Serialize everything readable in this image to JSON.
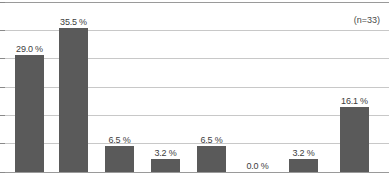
{
  "annotation": {
    "sample_size_label": "(n=33)"
  },
  "chart_data": {
    "type": "bar",
    "title": "",
    "subtitle": "",
    "xlabel": "",
    "ylabel": "",
    "categories": [
      "1",
      "2",
      "3",
      "4",
      "5",
      "6",
      "7",
      "8"
    ],
    "values": [
      29.0,
      35.5,
      6.5,
      3.2,
      6.5,
      0.0,
      3.2,
      16.1
    ],
    "data_labels": [
      "29.0 %",
      "35.5 %",
      "6.5 %",
      "3.2 %",
      "6.5 %",
      "0.0 %",
      "3.2 %",
      "16.1 %"
    ],
    "ylim": [
      0,
      42
    ],
    "ytick_values": [
      0,
      7,
      14,
      21,
      28,
      35,
      42
    ],
    "ytick_labels": [
      "",
      "",
      "",
      "",
      "",
      "",
      ""
    ],
    "grid": true,
    "legend": false,
    "legend_position": "none",
    "annotations": [
      "(n=33)"
    ],
    "series": [
      {
        "name": "percentage",
        "values": [
          29.0,
          35.5,
          6.5,
          3.2,
          6.5,
          0.0,
          3.2,
          16.1
        ]
      }
    ],
    "colors": {
      "bar": "#5a5a5a",
      "gridline": "#c8c8c8",
      "frame": "#9a9a9a",
      "label_text": "#3d3d3d",
      "background": "#ffffff"
    }
  }
}
